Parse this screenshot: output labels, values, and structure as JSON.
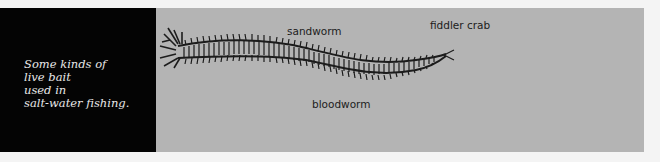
{
  "caption": {
    "lines": [
      "Some kinds of",
      "live bait",
      "used in",
      "salt-water fishing."
    ]
  },
  "illustrations": [
    {
      "label": "sandworm",
      "icon": "sandworm-drawing"
    },
    {
      "label": "bloodworm",
      "icon": "bloodworm-drawing"
    },
    {
      "label": "fiddler crab",
      "icon": "fiddler-crab-drawing"
    }
  ],
  "colors": {
    "caption_bg": "#040404",
    "caption_text": "#e8e8e8",
    "illustration_bg": "#b4b4b4",
    "ink": "#1c1c1c",
    "page_bg": "#f4f4f4"
  }
}
